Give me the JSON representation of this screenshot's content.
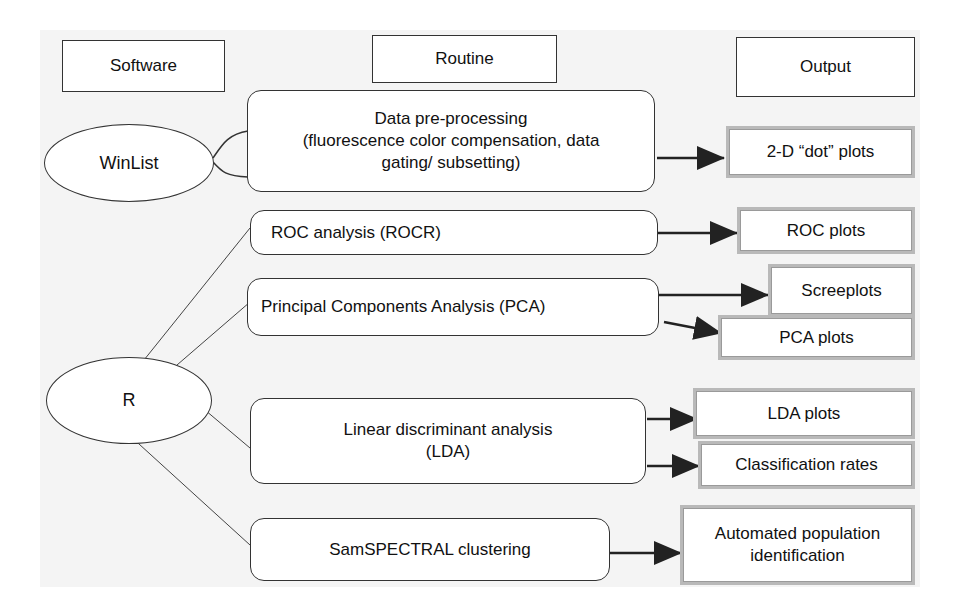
{
  "headers": {
    "software": "Software",
    "routine": "Routine",
    "output": "Output"
  },
  "software": {
    "winlist": "WinList",
    "r": "R"
  },
  "routines": {
    "preprocessing": {
      "line1": "Data pre-processing",
      "line2": "(fluorescence color compensation, data",
      "line3": "gating/ subsetting)"
    },
    "roc": "ROC analysis (ROCR)",
    "pca": "Principal Components Analysis (PCA)",
    "lda": {
      "line1": "Linear discriminant analysis",
      "line2": "(LDA)"
    },
    "samspectral": "SamSPECTRAL clustering"
  },
  "outputs": {
    "dot_plots": "2-D “dot” plots",
    "roc_plots": "ROC plots",
    "screeplots": "Screeplots",
    "pca_plots": "PCA plots",
    "lda_plots": "LDA plots",
    "classification_rates": "Classification rates",
    "automated": {
      "line1": "Automated population",
      "line2": "identification"
    }
  }
}
